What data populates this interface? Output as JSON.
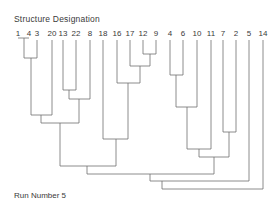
{
  "diagram": {
    "title": "Structure  Designation",
    "footer": "Run  Number  5",
    "type": "dendrogram",
    "line_color": "#707070",
    "text_color": "#3a3a3a",
    "leaves": [
      {
        "label": "1",
        "x": 18
      },
      {
        "label": "4",
        "x": 29
      },
      {
        "label": "3",
        "x": 37
      },
      {
        "label": "20",
        "x": 52
      },
      {
        "label": "13",
        "x": 63
      },
      {
        "label": "22",
        "x": 76
      },
      {
        "label": "8",
        "x": 90
      },
      {
        "label": "18",
        "x": 103
      },
      {
        "label": "16",
        "x": 117
      },
      {
        "label": "17",
        "x": 130
      },
      {
        "label": "12",
        "x": 143
      },
      {
        "label": "9",
        "x": 156
      },
      {
        "label": "4",
        "x": 170
      },
      {
        "label": "6",
        "x": 183
      },
      {
        "label": "10",
        "x": 197
      },
      {
        "label": "11",
        "x": 211
      },
      {
        "label": "7",
        "x": 223
      },
      {
        "label": "2",
        "x": 236
      },
      {
        "label": "5",
        "x": 249
      },
      {
        "label": "14",
        "x": 263
      }
    ],
    "merges": [
      {
        "left_x": 18,
        "right_x": 29,
        "y": 38,
        "left_top": 38,
        "right_top": 38
      },
      {
        "left_x": 24,
        "right_x": 37,
        "y": 58,
        "left_top": 38,
        "right_top": 40
      },
      {
        "left_x": 31,
        "right_x": 52,
        "y": 115,
        "left_top": 58,
        "right_top": 40
      },
      {
        "left_x": 63,
        "right_x": 76,
        "y": 90,
        "left_top": 40,
        "right_top": 40
      },
      {
        "left_x": 69,
        "right_x": 90,
        "y": 99,
        "left_top": 90,
        "right_top": 40
      },
      {
        "left_x": 41,
        "right_x": 79,
        "y": 123,
        "left_top": 115,
        "right_top": 99
      },
      {
        "left_x": 143,
        "right_x": 156,
        "y": 54,
        "left_top": 40,
        "right_top": 40
      },
      {
        "left_x": 130,
        "right_x": 150,
        "y": 66,
        "left_top": 40,
        "right_top": 54
      },
      {
        "left_x": 117,
        "right_x": 140,
        "y": 83,
        "left_top": 40,
        "right_top": 66
      },
      {
        "left_x": 103,
        "right_x": 128,
        "y": 139,
        "left_top": 40,
        "right_top": 83
      },
      {
        "left_x": 60,
        "right_x": 116,
        "y": 166,
        "left_top": 123,
        "right_top": 139
      },
      {
        "left_x": 170,
        "right_x": 183,
        "y": 75,
        "left_top": 40,
        "right_top": 40
      },
      {
        "left_x": 176,
        "right_x": 197,
        "y": 107,
        "left_top": 75,
        "right_top": 40
      },
      {
        "left_x": 187,
        "right_x": 211,
        "y": 149,
        "left_top": 107,
        "right_top": 40
      },
      {
        "left_x": 223,
        "right_x": 236,
        "y": 132,
        "left_top": 40,
        "right_top": 40
      },
      {
        "left_x": 199,
        "right_x": 229,
        "y": 157,
        "left_top": 149,
        "right_top": 132
      },
      {
        "left_x": 87,
        "right_x": 214,
        "y": 174,
        "left_top": 166,
        "right_top": 157
      },
      {
        "left_x": 150,
        "right_x": 249,
        "y": 181,
        "left_top": 174,
        "right_top": 40
      },
      {
        "left_x": 162,
        "right_x": 263,
        "y": 189,
        "left_top": 181,
        "right_top": 40
      }
    ]
  }
}
